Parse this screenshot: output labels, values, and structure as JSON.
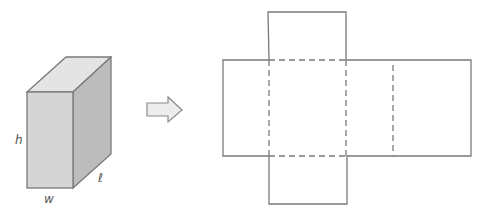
{
  "diagram": {
    "box": {
      "labels": {
        "height": "h",
        "width": "w",
        "length": "ℓ"
      },
      "colors": {
        "front": "#d6d6d6",
        "top": "#e6e6e6",
        "side": "#bdbdbd",
        "edge": "#7a7a7a"
      }
    },
    "arrow": {
      "direction": "right",
      "fill": "#eeeeee",
      "stroke": "#8a8a8a"
    },
    "net": {
      "stroke": "#7a7a7a",
      "faces": [
        "left side",
        "front",
        "right side",
        "back",
        "top flap",
        "bottom flap"
      ],
      "fold_lines": "dashed"
    }
  }
}
